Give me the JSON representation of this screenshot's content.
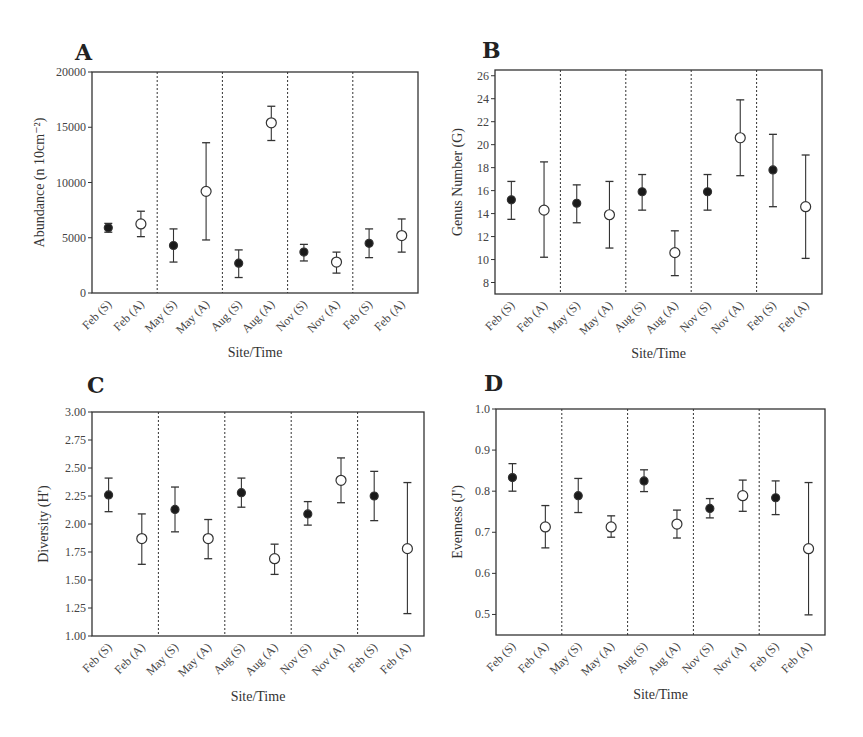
{
  "chart_data": [
    {
      "panel": "A",
      "type": "scatter",
      "title": "A",
      "xlabel": "Site/Time",
      "ylabel": "Abundance (n 10cm⁻²)",
      "ylim": [
        0,
        20000
      ],
      "yticks": [
        0,
        5000,
        10000,
        15000,
        20000
      ],
      "ytick_labels": [
        "0",
        "5000",
        "10000",
        "15000",
        "20000"
      ],
      "categories": [
        "Feb (S)",
        "Feb (A)",
        "May (S)",
        "May (A)",
        "Aug (S)",
        "Aug (A)",
        "Nov (S)",
        "Nov (A)",
        "Feb (S)",
        "Feb (A)"
      ],
      "marker": [
        "filled",
        "open",
        "filled",
        "open",
        "filled",
        "open",
        "filled",
        "open",
        "filled",
        "open"
      ],
      "values": [
        5900,
        6250,
        4300,
        9200,
        2700,
        15400,
        3700,
        2800,
        4500,
        5200
      ],
      "err_low": [
        5500,
        5100,
        2800,
        4800,
        1400,
        13800,
        2900,
        1800,
        3200,
        3700
      ],
      "err_high": [
        6300,
        7400,
        5800,
        13600,
        3900,
        16900,
        4400,
        3700,
        5800,
        6700
      ],
      "grid": false,
      "dividers_after_index": [
        1,
        3,
        5,
        7
      ]
    },
    {
      "panel": "B",
      "type": "scatter",
      "title": "B",
      "xlabel": "Site/Time",
      "ylabel": "Genus Number (G)",
      "ylim": [
        7,
        26.5
      ],
      "yticks": [
        8,
        10,
        12,
        14,
        16,
        18,
        20,
        22,
        24,
        26
      ],
      "ytick_labels": [
        "8",
        "10",
        "12",
        "14",
        "16",
        "18",
        "20",
        "22",
        "24",
        "26"
      ],
      "categories": [
        "Feb (S)",
        "Feb (A)",
        "May (S)",
        "May (A)",
        "Aug (S)",
        "Aug (A)",
        "Nov (S)",
        "Nov (A)",
        "Feb (S)",
        "Feb (A)"
      ],
      "marker": [
        "filled",
        "open",
        "filled",
        "open",
        "filled",
        "open",
        "filled",
        "open",
        "filled",
        "open"
      ],
      "values": [
        15.2,
        14.3,
        14.9,
        13.9,
        15.9,
        10.6,
        15.9,
        20.6,
        17.8,
        14.6
      ],
      "err_low": [
        13.5,
        10.2,
        13.2,
        11.0,
        14.3,
        8.6,
        14.3,
        17.3,
        14.6,
        10.1
      ],
      "err_high": [
        16.8,
        18.5,
        16.5,
        16.8,
        17.4,
        12.5,
        17.4,
        23.9,
        20.9,
        19.1
      ],
      "grid": false,
      "dividers_after_index": [
        1,
        3,
        5,
        7
      ]
    },
    {
      "panel": "C",
      "type": "scatter",
      "title": "C",
      "xlabel": "Site/Time",
      "ylabel": "Diversity (H')",
      "ylim": [
        1.0,
        3.0
      ],
      "yticks": [
        1.0,
        1.25,
        1.5,
        1.75,
        2.0,
        2.25,
        2.5,
        2.75,
        3.0
      ],
      "ytick_labels": [
        "1.00",
        "1.25",
        "1.50",
        "1.75",
        "2.00",
        "2.25",
        "2.50",
        "2.75",
        "3.00"
      ],
      "categories": [
        "Feb (S)",
        "Feb (A)",
        "May (S)",
        "May (A)",
        "Aug (S)",
        "Aug (A)",
        "Nov (S)",
        "Nov (A)",
        "Feb (S)",
        "Feb (A)"
      ],
      "marker": [
        "filled",
        "open",
        "filled",
        "open",
        "filled",
        "open",
        "filled",
        "open",
        "filled",
        "open"
      ],
      "values": [
        2.26,
        1.87,
        2.13,
        1.87,
        2.28,
        1.69,
        2.09,
        2.39,
        2.25,
        1.78
      ],
      "err_low": [
        2.11,
        1.64,
        1.93,
        1.69,
        2.15,
        1.55,
        1.99,
        2.19,
        2.03,
        1.2
      ],
      "err_high": [
        2.41,
        2.09,
        2.33,
        2.04,
        2.41,
        1.82,
        2.2,
        2.59,
        2.47,
        2.37
      ],
      "grid": false,
      "dividers_after_index": [
        1,
        3,
        5,
        7
      ]
    },
    {
      "panel": "D",
      "type": "scatter",
      "title": "D",
      "xlabel": "Site/Time",
      "ylabel": "Evenness (J')",
      "ylim": [
        0.45,
        1.0
      ],
      "yticks": [
        0.5,
        0.6,
        0.7,
        0.8,
        0.9,
        1.0
      ],
      "ytick_labels": [
        "0.5",
        "0.6",
        "0.7",
        "0.8",
        "0.9",
        "1.0"
      ],
      "categories": [
        "Feb (S)",
        "Feb (A)",
        "May (S)",
        "May (A)",
        "Aug (S)",
        "Aug (A)",
        "Nov (S)",
        "Nov (A)",
        "Feb (S)",
        "Feb (A)"
      ],
      "marker": [
        "filled",
        "open",
        "filled",
        "open",
        "filled",
        "open",
        "filled",
        "open",
        "filled",
        "open"
      ],
      "values": [
        0.833,
        0.713,
        0.789,
        0.713,
        0.825,
        0.72,
        0.758,
        0.789,
        0.784,
        0.66
      ],
      "err_low": [
        0.8,
        0.662,
        0.748,
        0.688,
        0.799,
        0.686,
        0.735,
        0.751,
        0.743,
        0.499
      ],
      "err_high": [
        0.867,
        0.765,
        0.831,
        0.74,
        0.852,
        0.754,
        0.782,
        0.827,
        0.825,
        0.821
      ],
      "grid": false,
      "dividers_after_index": [
        1,
        3,
        5,
        7
      ]
    }
  ]
}
